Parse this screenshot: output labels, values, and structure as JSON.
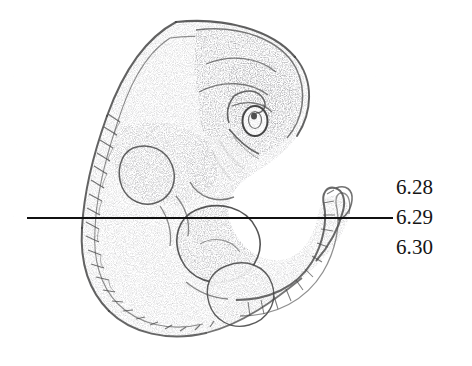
{
  "figure": {
    "style": "stippled pen-and-ink anatomical illustration",
    "background_color": "#fefefe",
    "ink_color": "#3a3a3a",
    "parts": [
      "head",
      "optic-vesicle",
      "otic-vesicle",
      "pharyngeal-arches",
      "somites",
      "heart-bulge",
      "forelimb-bud",
      "hindlimb-bud",
      "tail"
    ]
  },
  "leader_line": {
    "color": "#111111",
    "orientation": "horizontal",
    "thickness_px": 2,
    "start_x": 27,
    "end_x": 393,
    "y": 217
  },
  "labels": {
    "color": "#151515",
    "items": [
      {
        "text": "6.28"
      },
      {
        "text": "6.29"
      },
      {
        "text": "6.30"
      }
    ]
  }
}
